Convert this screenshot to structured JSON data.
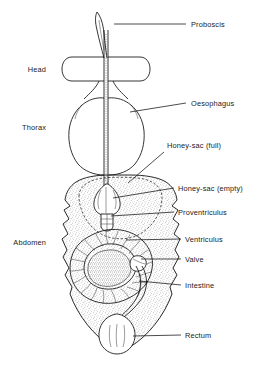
{
  "figure": {
    "background_color": "#ffffff",
    "ink_color": "#111111",
    "width": 263,
    "height": 365
  },
  "body_regions": [
    {
      "id": "head",
      "label": "Head",
      "x": 46,
      "y": 72
    },
    {
      "id": "thorax",
      "label": "Thorax",
      "x": 46,
      "y": 130
    },
    {
      "id": "abdomen",
      "label": "Abdomen",
      "x": 46,
      "y": 245
    }
  ],
  "organ_labels": [
    {
      "id": "proboscis",
      "label": "Proboscis",
      "x": 191,
      "y": 27,
      "leader": [
        [
          163,
          24
        ],
        [
          186,
          24
        ]
      ]
    },
    {
      "id": "oesophagus",
      "label": "Oesophagus",
      "x": 191,
      "y": 106,
      "leader": [
        [
          130,
          112
        ],
        [
          186,
          103
        ]
      ]
    },
    {
      "id": "honey-sac-full",
      "label": "Honey-sac (full)",
      "x": 167,
      "y": 148,
      "leader": [
        [
          128,
          183
        ],
        [
          164,
          152
        ]
      ]
    },
    {
      "id": "honey-sac-empty",
      "label": "Honey-sac (empty)",
      "x": 178,
      "y": 191,
      "leader": [
        [
          113,
          198
        ],
        [
          174,
          188
        ]
      ]
    },
    {
      "id": "proventriculus",
      "label": "Proventriculus",
      "x": 178,
      "y": 215,
      "leader": [
        [
          111,
          216
        ],
        [
          174,
          212
        ]
      ]
    },
    {
      "id": "ventriculus",
      "label": "Ventriculus",
      "x": 185,
      "y": 242,
      "leader": [
        [
          126,
          240
        ],
        [
          181,
          239
        ]
      ]
    },
    {
      "id": "valve",
      "label": "Valve",
      "x": 185,
      "y": 262,
      "leader": [
        [
          141,
          259
        ],
        [
          181,
          259
        ]
      ]
    },
    {
      "id": "intestine",
      "label": "Intestine",
      "x": 185,
      "y": 288,
      "leader": [
        [
          139,
          280
        ],
        [
          181,
          285
        ]
      ]
    },
    {
      "id": "rectum",
      "label": "Rectum",
      "x": 185,
      "y": 338,
      "leader": [
        [
          133,
          336
        ],
        [
          181,
          335
        ]
      ]
    }
  ]
}
